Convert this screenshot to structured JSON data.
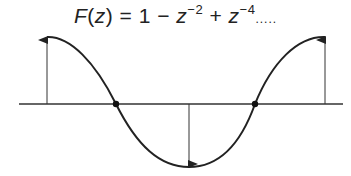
{
  "formula": {
    "func": "F",
    "var": "z",
    "lhs_open": "(",
    "lhs_close": ")",
    "equals": " = ",
    "term1": "1",
    "op1": " − ",
    "term2_base": "z",
    "term2_exp": "−2",
    "op2": " + ",
    "term3_base": "z",
    "term3_exp": "−4",
    "ellipsis": "....."
  },
  "diagram": {
    "axis": {
      "x1": 19,
      "x2": 343,
      "y": 104
    },
    "curve_color": "#222222",
    "axis_color": "#333333",
    "zero_crossings": [
      {
        "x": 116,
        "y": 104
      },
      {
        "x": 255,
        "y": 104
      }
    ],
    "arrows": [
      {
        "x": 47,
        "from_y": 104,
        "to_y": 37,
        "direction": "up"
      },
      {
        "x": 189,
        "from_y": 104,
        "to_y": 167,
        "direction": "down"
      },
      {
        "x": 325,
        "from_y": 104,
        "to_y": 37,
        "direction": "up"
      }
    ]
  }
}
